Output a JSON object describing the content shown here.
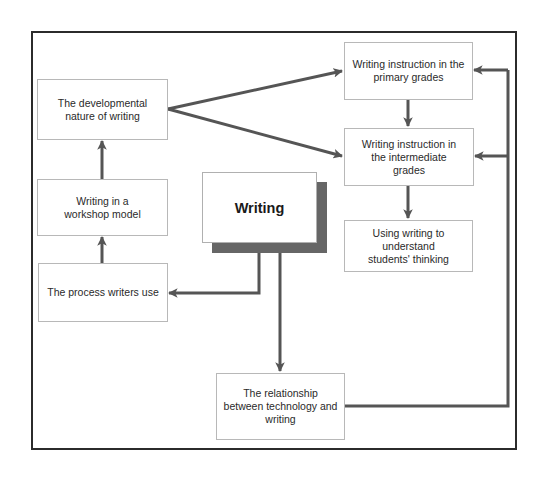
{
  "diagram": {
    "central_topic": "Writing",
    "nodes": {
      "developmental": "The developmental nature of writing",
      "workshop": "Writing in a workshop model",
      "process": "The process writers use",
      "primary": "Writing instruction in the primary grades",
      "intermediate": "Writing instruction in the intermediate grades",
      "understand": "Using writing to understand students' thinking",
      "technology": "The relationship between technology and writing"
    },
    "edges": [
      {
        "from": "Writing",
        "to": "The process writers use"
      },
      {
        "from": "Writing",
        "to": "The relationship between technology and writing"
      },
      {
        "from": "The process writers use",
        "to": "Writing in a workshop model"
      },
      {
        "from": "Writing in a workshop model",
        "to": "The developmental nature of writing"
      },
      {
        "from": "The developmental nature of writing",
        "to": "Writing instruction in the primary grades"
      },
      {
        "from": "The developmental nature of writing",
        "to": "Writing instruction in the intermediate grades"
      },
      {
        "from": "Writing instruction in the primary grades",
        "to": "Writing instruction in the intermediate grades"
      },
      {
        "from": "Writing instruction in the intermediate grades",
        "to": "Using writing to understand students' thinking"
      },
      {
        "from": "The relationship between technology and writing",
        "to": "Writing instruction in the primary grades"
      },
      {
        "from": "The relationship between technology and writing",
        "to": "Writing instruction in the intermediate grades"
      }
    ],
    "colors": {
      "arrow": "#555555",
      "frame": "#2b2b2b",
      "box_border": "#b8b8b8",
      "shadow": "#666666"
    }
  }
}
